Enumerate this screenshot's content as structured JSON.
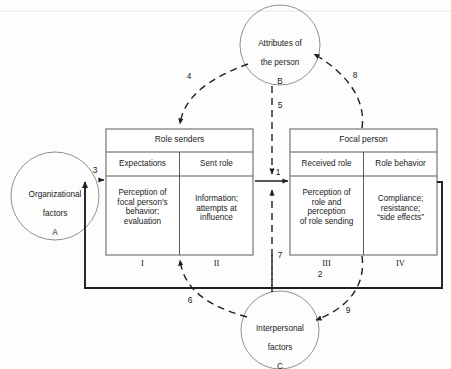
{
  "figure": {
    "type": "role-episode-model-diagram",
    "background_color": "#fdfdfd",
    "line_color": "#333333",
    "circle_stroke": "#8a8a8a"
  },
  "circles": [
    {
      "id": "A",
      "name": "organizational-factors",
      "line1": "Organizational",
      "line2": "factors",
      "letter": "A",
      "cx": 55,
      "cy": 196,
      "r": 44
    },
    {
      "id": "B",
      "name": "attributes-of-the-person",
      "line1": "Attributes of",
      "line2": "the person",
      "letter": "B",
      "cx": 280,
      "cy": 45,
      "r": 40
    },
    {
      "id": "C",
      "name": "interpersonal-factors",
      "line1": "Interpersonal",
      "line2": "factors",
      "letter": "C",
      "cx": 280,
      "cy": 330,
      "r": 39
    }
  ],
  "boxes": [
    {
      "id": "role-senders",
      "title": "Role senders",
      "x": 106,
      "y": 129,
      "w": 147,
      "h": 126,
      "cells": [
        {
          "id": "I",
          "subheader": "Expectations",
          "body": "Perception of\nfocal person's\nbehavior;\nevaluation",
          "numeral": "I"
        },
        {
          "id": "II",
          "subheader": "Sent role",
          "body": "Information;\nattempts at\ninfluence",
          "numeral": "II"
        }
      ]
    },
    {
      "id": "focal-person",
      "title": "Focal person",
      "x": 290,
      "y": 129,
      "w": 147,
      "h": 126,
      "cells": [
        {
          "id": "III",
          "subheader": "Received role",
          "body": "Perception of\nrole and\nperception\nof role sending",
          "numeral": "III"
        },
        {
          "id": "IV",
          "subheader": "Role behavior",
          "body": "Compliance;\nresistance;\n“side effects”",
          "numeral": "IV"
        }
      ]
    }
  ],
  "arrows": [
    {
      "number": "1",
      "name": "arrow-1-sent-role-to-received-role",
      "style": "solid",
      "from": "Role senders",
      "to": "Focal person",
      "label_x": 278,
      "label_y": 173
    },
    {
      "number": "2",
      "name": "arrow-2-role-behavior-feedback",
      "style": "thick",
      "from": "Role behavior (IV)",
      "to": "Role senders",
      "label_x": 320,
      "label_y": 276
    },
    {
      "number": "3",
      "name": "arrow-3-organizational-factors-to-role-senders",
      "style": "solid",
      "from": "Organizational factors A",
      "to": "Role senders",
      "label_x": 95,
      "label_y": 172
    },
    {
      "number": "4",
      "name": "arrow-4-attributes-to-role-senders",
      "style": "dashed",
      "from": "Attributes of the person B",
      "to": "Role senders",
      "label_x": 189,
      "label_y": 78
    },
    {
      "number": "5",
      "name": "arrow-5-attributes-to-role-episode",
      "style": "dashed",
      "from": "Attributes of the person B",
      "to": "Role episode",
      "label_x": 279,
      "label_y": 107
    },
    {
      "number": "6",
      "name": "arrow-6-interpersonal-to-role-senders",
      "style": "dashed",
      "from": "Interpersonal factors C",
      "to": "Role senders",
      "label_x": 190,
      "label_y": 302
    },
    {
      "number": "7",
      "name": "arrow-7-interpersonal-to-role-episode",
      "style": "dashed",
      "from": "Interpersonal factors C",
      "to": "Role episode",
      "label_x": 278,
      "label_y": 257
    },
    {
      "number": "8",
      "name": "arrow-8-focal-person-to-attributes",
      "style": "dashed",
      "from": "Focal person",
      "to": "Attributes of the person B",
      "label_x": 355,
      "label_y": 77
    },
    {
      "number": "9",
      "name": "arrow-9-focal-person-to-interpersonal",
      "style": "dashed",
      "from": "Focal person",
      "to": "Interpersonal factors C",
      "label_x": 348,
      "label_y": 312
    }
  ]
}
